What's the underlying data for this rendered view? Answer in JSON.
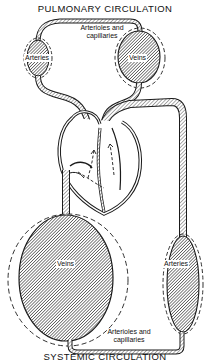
{
  "diagram": {
    "title_top": "PULMONARY CIRCULATION",
    "title_bottom": "SYSTEMIC CIRCULATION",
    "pulmonary": {
      "arteries_label": "Arteries",
      "veins_label": "Veins",
      "capillaries_label_line1": "Arterioles and",
      "capillaries_label_line2": "capillaries"
    },
    "systemic": {
      "veins_label": "Veins",
      "arteries_label": "Arteries",
      "capillaries_label_line1": "Arterioles and",
      "capillaries_label_line2": "capillaries"
    },
    "colors": {
      "line": "#1a1a1a",
      "hatch": "#333333",
      "background": "#ffffff"
    }
  }
}
